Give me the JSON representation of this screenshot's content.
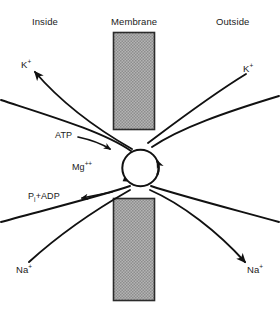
{
  "figure": {
    "background_color": "#ffffff",
    "line_color": "#111111",
    "text_color": "#1a1a1a",
    "membrane_fill": "#a8a8a8",
    "membrane_border": "#2b2b2b"
  },
  "headers": {
    "inside": "Inside",
    "membrane": "Membrane",
    "outside": "Outside"
  },
  "ions": {
    "potassium_inside": {
      "element": "K",
      "charge": "+"
    },
    "potassium_outside": {
      "element": "K",
      "charge": "+"
    },
    "sodium_inside": {
      "element": "Na",
      "charge": "+"
    },
    "sodium_outside": {
      "element": "Na",
      "charge": "+"
    }
  },
  "chemicals": {
    "atp": "ATP",
    "magnesium_element": "Mg",
    "magnesium_charge": "++",
    "products_prefix": "P",
    "products_subscript": "i",
    "products_suffix": "+ADP"
  }
}
